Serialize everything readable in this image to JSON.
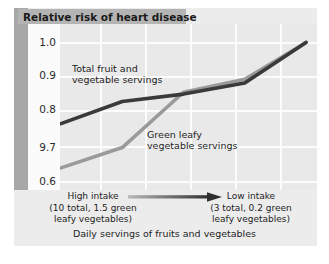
{
  "figure": {
    "title": "Relative risk of heart disease",
    "caption": "Daily servings of fruits and vegetables"
  },
  "axis": {
    "y_ticks": [
      "1.0",
      "0.9",
      "0.8",
      "9.7",
      "0.6"
    ]
  },
  "series_labels": {
    "total": "Total fruit and\nvegetable servings",
    "total_line1": "Total fruit and",
    "total_line2": "vegetable servings",
    "green_line1": "Green leafy",
    "green_line2": "vegetable servings"
  },
  "annotations": {
    "left_title": "High intake",
    "left_sub1": "(10 total, 1.5 green",
    "left_sub2": "leafy vegetables)",
    "right_title": "Low intake",
    "right_sub1": "(3 total, 0.2 green",
    "right_sub2": "leafy vegetables)",
    "arrow": "arrow-right-icon"
  },
  "colors": {
    "total_line": "#3a3a3a",
    "green_line": "#9a9a9a",
    "plot_bg": "#e9e9e9",
    "grid": "#fcfcfc",
    "banner": "#b4b4b4",
    "strip": "#a8a8a8"
  },
  "chart_data": {
    "type": "line",
    "title": "Relative risk of heart disease",
    "xlabel": "Daily servings of fruits and vegetables",
    "ylabel": "Relative risk of heart disease",
    "ylim": [
      0.6,
      1.05
    ],
    "y_ticks": [
      1.0,
      0.9,
      0.8,
      0.7,
      0.6
    ],
    "y_tick_labels": [
      "1.0",
      "0.9",
      "0.8",
      "9.7",
      "0.6"
    ],
    "grid": true,
    "legend": "inline-labels",
    "x": [
      1,
      2,
      3,
      4,
      5
    ],
    "x_description": "quintiles of intake, from high intake (left) to low intake (right)",
    "series": [
      {
        "name": "Total fruit and vegetable servings",
        "color": "#3a3a3a",
        "values": [
          0.78,
          0.84,
          0.86,
          0.89,
          1.0
        ]
      },
      {
        "name": "Green leafy vegetable servings",
        "color": "#9a9a9a",
        "values": [
          0.66,
          0.715,
          0.865,
          0.9,
          1.0
        ]
      }
    ]
  }
}
